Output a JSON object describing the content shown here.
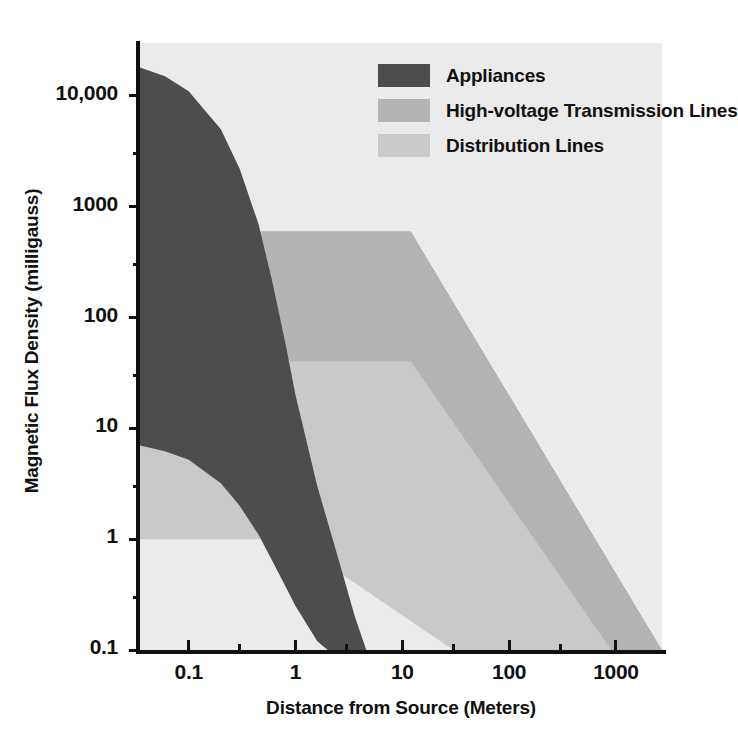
{
  "chart_data": {
    "type": "area",
    "title": "",
    "xlabel": "Distance from Source (Meters)",
    "ylabel": "Magnetic Flux Density (milligauss)",
    "xscale": "log",
    "yscale": "log",
    "xlim": [
      0.035,
      2700
    ],
    "ylim": [
      0.1,
      30000
    ],
    "grid": false,
    "legend_position": "top-right",
    "xticks": [
      "0.1",
      "1",
      "10",
      "100",
      "1000"
    ],
    "xtick_values": [
      0.1,
      1,
      10,
      100,
      1000
    ],
    "yticks": [
      "10,000",
      "1000",
      "100",
      "10",
      "1",
      "0.1"
    ],
    "ytick_values": [
      10000,
      1000,
      100,
      10,
      1,
      0.1
    ],
    "colors": {
      "appliances": "#4d4d4d",
      "high_voltage": "#b4b4b4",
      "distribution": "#c9c9c9",
      "plot_background": "#ebebeb",
      "axis": "#111111",
      "text": "#111111"
    },
    "series": [
      {
        "name": "Appliances",
        "color": "#4d4d4d",
        "upper_bound": [
          {
            "x": 0.035,
            "y": 18000
          },
          {
            "x": 0.06,
            "y": 15000
          },
          {
            "x": 0.1,
            "y": 11000
          },
          {
            "x": 0.2,
            "y": 5000
          },
          {
            "x": 0.3,
            "y": 2200
          },
          {
            "x": 0.45,
            "y": 700
          },
          {
            "x": 0.6,
            "y": 220
          },
          {
            "x": 0.8,
            "y": 60
          },
          {
            "x": 1.0,
            "y": 20
          },
          {
            "x": 1.6,
            "y": 3.0
          },
          {
            "x": 2.6,
            "y": 0.6
          },
          {
            "x": 3.6,
            "y": 0.2
          },
          {
            "x": 4.6,
            "y": 0.1
          }
        ],
        "lower_bound": [
          {
            "x": 0.035,
            "y": 7.0
          },
          {
            "x": 0.06,
            "y": 6.2
          },
          {
            "x": 0.1,
            "y": 5.2
          },
          {
            "x": 0.2,
            "y": 3.2
          },
          {
            "x": 0.3,
            "y": 2.0
          },
          {
            "x": 0.45,
            "y": 1.1
          },
          {
            "x": 0.6,
            "y": 0.65
          },
          {
            "x": 0.8,
            "y": 0.38
          },
          {
            "x": 1.0,
            "y": 0.25
          },
          {
            "x": 1.6,
            "y": 0.12
          },
          {
            "x": 2.0,
            "y": 0.1
          }
        ]
      },
      {
        "name": "High-voltage Transmission Lines",
        "color": "#b4b4b4",
        "upper_bound": [
          {
            "x": 0.035,
            "y": 600
          },
          {
            "x": 12,
            "y": 600
          },
          {
            "x": 2700,
            "y": 0.1
          }
        ],
        "lower_bound": [
          {
            "x": 0.035,
            "y": 40
          },
          {
            "x": 12,
            "y": 40
          },
          {
            "x": 900,
            "y": 0.1
          }
        ]
      },
      {
        "name": "Distribution Lines",
        "color": "#c9c9c9",
        "upper_bound": [
          {
            "x": 0.035,
            "y": 40
          },
          {
            "x": 12,
            "y": 40
          },
          {
            "x": 900,
            "y": 0.1
          }
        ],
        "lower_bound": [
          {
            "x": 0.035,
            "y": 1.0
          },
          {
            "x": 0.9,
            "y": 1.0
          },
          {
            "x": 30,
            "y": 0.1
          }
        ]
      }
    ]
  },
  "axes": {
    "y_title": "Magnetic Flux Density (milligauss)",
    "x_title": "Distance from Source (Meters)",
    "y_ticks": [
      {
        "label": "10,000",
        "value": 10000
      },
      {
        "label": "1000",
        "value": 1000
      },
      {
        "label": "100",
        "value": 100
      },
      {
        "label": "10",
        "value": 10
      },
      {
        "label": "1",
        "value": 1
      },
      {
        "label": "0.1",
        "value": 0.1
      }
    ],
    "x_ticks": [
      {
        "label": "0.1",
        "value": 0.1
      },
      {
        "label": "1",
        "value": 1
      },
      {
        "label": "10",
        "value": 10
      },
      {
        "label": "100",
        "value": 100
      },
      {
        "label": "1000",
        "value": 1000
      }
    ]
  },
  "legend": {
    "items": [
      {
        "label": "Appliances",
        "color": "#4d4d4d"
      },
      {
        "label": "High-voltage Transmission Lines",
        "color": "#b4b4b4"
      },
      {
        "label": "Distribution Lines",
        "color": "#c9c9c9"
      }
    ]
  }
}
